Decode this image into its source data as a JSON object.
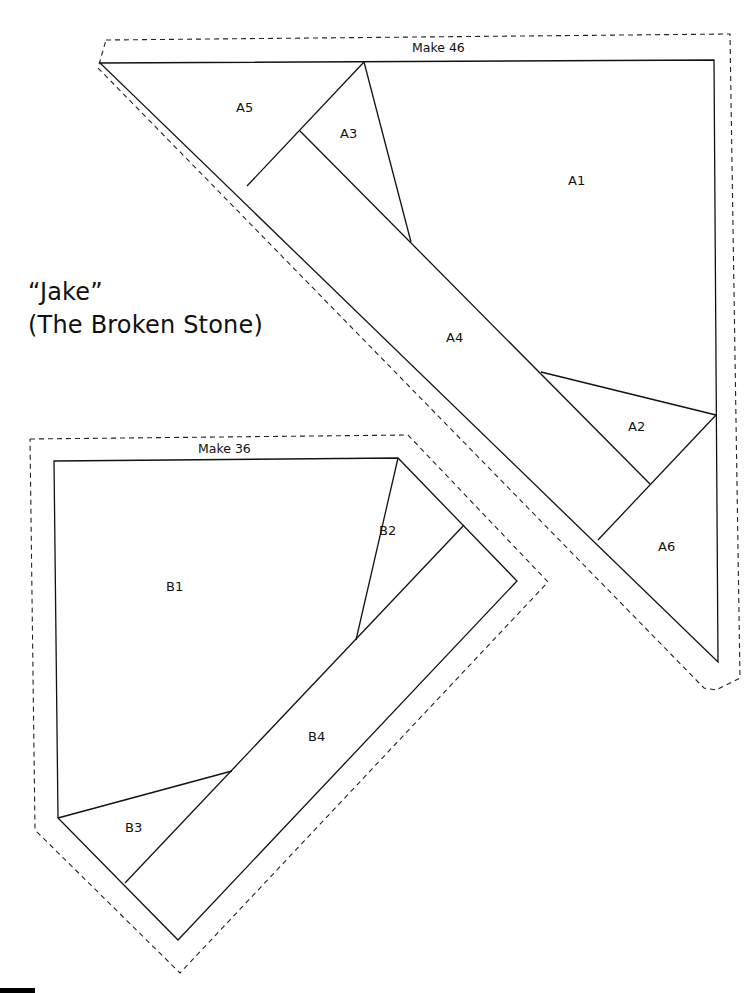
{
  "title": {
    "name": "“Jake”",
    "subtitle": "(The Broken Stone)"
  },
  "template_a": {
    "make_label": "Make 46",
    "pieces": [
      {
        "id": "A1",
        "label": "A1"
      },
      {
        "id": "A2",
        "label": "A2"
      },
      {
        "id": "A3",
        "label": "A3"
      },
      {
        "id": "A4",
        "label": "A4"
      },
      {
        "id": "A5",
        "label": "A5"
      },
      {
        "id": "A6",
        "label": "A6"
      }
    ]
  },
  "template_b": {
    "make_label": "Make 36",
    "pieces": [
      {
        "id": "B1",
        "label": "B1"
      },
      {
        "id": "B2",
        "label": "B2"
      },
      {
        "id": "B3",
        "label": "B3"
      },
      {
        "id": "B4",
        "label": "B4"
      }
    ]
  },
  "colors": {
    "line": "#111111",
    "background": "#ffffff"
  }
}
